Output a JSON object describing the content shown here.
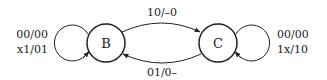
{
  "diagram": {
    "type": "state-machine",
    "colors": {
      "stroke": "#222222",
      "background": "#ffffff"
    },
    "states": [
      {
        "id": "B",
        "label": "B"
      },
      {
        "id": "C",
        "label": "C"
      }
    ],
    "transitions": {
      "b_to_c": {
        "from": "B",
        "to": "C",
        "label": "10/–0"
      },
      "c_to_b": {
        "from": "C",
        "to": "B",
        "label": "01/0–"
      },
      "b_self": {
        "from": "B",
        "to": "B",
        "labels": [
          "00/00",
          "x1/01"
        ]
      },
      "c_self": {
        "from": "C",
        "to": "C",
        "labels": [
          "00/00",
          "1x/10"
        ]
      }
    }
  }
}
